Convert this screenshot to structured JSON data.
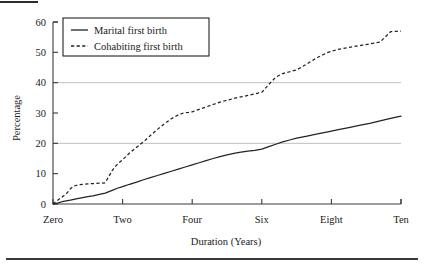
{
  "figure": {
    "background_color": "#ffffff",
    "ink_color": "#232323",
    "grid_color": "#bfbfbf",
    "top_rule": true,
    "bottom_rule": true
  },
  "chart_data": {
    "type": "line",
    "title": "",
    "xlabel": "Duration (Years)",
    "ylabel": "Percentage",
    "xlim": [
      0,
      10
    ],
    "ylim": [
      0,
      60
    ],
    "xticks": [
      0,
      2,
      4,
      6,
      8,
      10
    ],
    "xticklabels": [
      "Zero",
      "Two",
      "Four",
      "Six",
      "Eight",
      "Ten"
    ],
    "yticks": [
      0,
      10,
      20,
      30,
      40,
      50,
      60
    ],
    "yticklabels": [
      "0",
      "10",
      "20",
      "30",
      "40",
      "50",
      "60"
    ],
    "grid": "horizontal",
    "gridlines_y": [
      20,
      40
    ],
    "legend_position": "upper-left-inside",
    "series": [
      {
        "name": "Marital first birth",
        "style": "solid",
        "x": [
          0.0,
          0.15,
          0.3,
          0.5,
          0.7,
          0.85,
          1.0,
          1.15,
          1.3,
          1.5,
          1.7,
          1.85,
          2.0,
          2.2,
          2.4,
          2.6,
          2.8,
          3.0,
          3.2,
          3.4,
          3.6,
          3.8,
          4.0,
          4.2,
          4.4,
          4.6,
          4.8,
          5.0,
          5.2,
          5.4,
          5.6,
          5.8,
          6.0,
          6.2,
          6.4,
          6.6,
          6.8,
          7.0,
          7.3,
          7.6,
          7.9,
          8.2,
          8.5,
          8.8,
          9.1,
          9.4,
          9.7,
          10.0
        ],
        "values": [
          0.0,
          0.4,
          0.9,
          1.3,
          1.8,
          2.1,
          2.4,
          2.7,
          3.1,
          3.6,
          4.5,
          5.2,
          5.7,
          6.5,
          7.2,
          8.0,
          8.7,
          9.4,
          10.1,
          10.8,
          11.5,
          12.2,
          12.9,
          13.6,
          14.3,
          15.0,
          15.6,
          16.2,
          16.7,
          17.1,
          17.4,
          17.7,
          18.1,
          18.9,
          19.7,
          20.5,
          21.1,
          21.7,
          22.4,
          23.1,
          23.8,
          24.5,
          25.2,
          25.9,
          26.6,
          27.4,
          28.2,
          29.0
        ]
      },
      {
        "name": "Cohabiting first birth",
        "style": "dashed",
        "x": [
          0.0,
          0.1,
          0.25,
          0.4,
          0.5,
          0.6,
          0.75,
          0.9,
          1.0,
          1.1,
          1.25,
          1.4,
          1.5,
          1.6,
          1.7,
          1.8,
          1.9,
          2.0,
          2.1,
          2.2,
          2.35,
          2.5,
          2.65,
          2.8,
          3.0,
          3.2,
          3.4,
          3.6,
          3.75,
          3.9,
          4.0,
          4.2,
          4.4,
          4.6,
          4.8,
          5.0,
          5.2,
          5.4,
          5.6,
          5.8,
          6.0,
          6.2,
          6.4,
          6.6,
          6.8,
          7.0,
          7.3,
          7.6,
          7.9,
          8.2,
          8.5,
          8.8,
          9.1,
          9.4,
          9.7,
          10.0
        ],
        "values": [
          0.0,
          1.0,
          2.2,
          3.6,
          5.0,
          5.9,
          6.4,
          6.5,
          6.6,
          6.7,
          6.8,
          6.9,
          7.0,
          9.0,
          11.0,
          12.5,
          13.6,
          14.6,
          15.7,
          16.8,
          18.2,
          19.6,
          21.0,
          22.6,
          24.6,
          26.4,
          28.1,
          29.4,
          30.0,
          30.2,
          30.4,
          31.2,
          32.0,
          32.8,
          33.6,
          34.2,
          34.8,
          35.3,
          35.8,
          36.3,
          36.8,
          39.4,
          41.8,
          43.0,
          43.6,
          44.2,
          46.2,
          48.3,
          50.0,
          51.0,
          51.6,
          52.2,
          52.8,
          53.4,
          56.8,
          57.0
        ]
      }
    ]
  },
  "legend": {
    "entries": [
      {
        "label": "Marital first birth",
        "style": "solid"
      },
      {
        "label": "Cohabiting first birth",
        "style": "dashed"
      }
    ]
  }
}
